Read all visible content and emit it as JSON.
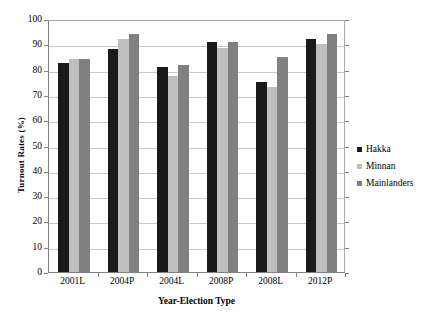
{
  "chart_data": {
    "type": "bar",
    "title": "",
    "subtitle": "",
    "xlabel": "Year-Election Type",
    "ylabel": "Turnout Rates (%)",
    "categories": [
      "2001L",
      "2004P",
      "2004L",
      "2008P",
      "2008L",
      "2012P"
    ],
    "series": [
      {
        "name": "Hakka",
        "color": "#1a1a1a",
        "values": [
          82.5,
          88.0,
          81.0,
          91.0,
          75.0,
          92.0
        ]
      },
      {
        "name": "Minnan",
        "color": "#bfbfbf",
        "values": [
          84.0,
          92.0,
          77.5,
          88.5,
          73.0,
          90.0
        ]
      },
      {
        "name": "Mainlanders",
        "color": "#808080",
        "values": [
          84.3,
          94.0,
          82.0,
          91.0,
          85.0,
          94.0
        ]
      }
    ],
    "ylim": [
      0,
      100
    ],
    "yticks": [
      0,
      10,
      20,
      30,
      40,
      50,
      60,
      70,
      80,
      90,
      100
    ],
    "ytick_labels": [
      "0",
      "10",
      "20",
      "30",
      "40",
      "50",
      "60",
      "70",
      "80",
      "90",
      "100"
    ],
    "grid": true,
    "grid_axis": "y",
    "legend_position": "right",
    "legend_entries": [
      "Hakka",
      "Minnan",
      "Mainlanders"
    ]
  }
}
